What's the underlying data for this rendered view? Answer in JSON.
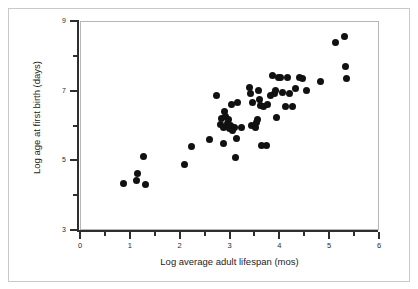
{
  "figure": {
    "background_color": "#ffffff",
    "frame_color": "#c9c9c9",
    "panel_border_color": "#b6b6b6",
    "axis_color": "#2e2e2e",
    "point_color": "#111111"
  },
  "chart_data": {
    "type": "scatter",
    "title": "",
    "xlabel": "Log average adult lifespan (mos)",
    "ylabel": "Log age at first birth (days)",
    "xlim": [
      0,
      6
    ],
    "ylim": [
      3,
      9
    ],
    "grid": false,
    "legend": null,
    "xticks": [
      0,
      1,
      2,
      3,
      4,
      5,
      6
    ],
    "xtick_labels": [
      "0",
      "1",
      "2",
      "3",
      "4",
      "5",
      "6"
    ],
    "xminor_ticks": [
      0.5,
      1.5,
      2.5,
      3.5,
      4.5,
      5.5
    ],
    "yticks": [
      3,
      5,
      7,
      9
    ],
    "ytick_labels": [
      "3",
      "5",
      "7",
      "9"
    ],
    "yminor_ticks": [
      4,
      6,
      8
    ],
    "marker": "filled-circle",
    "marker_size_px": 7,
    "n_points": 60,
    "points": [
      {
        "x": 0.85,
        "y": 4.37
      },
      {
        "x": 1.12,
        "y": 4.45
      },
      {
        "x": 1.14,
        "y": 4.64
      },
      {
        "x": 1.25,
        "y": 5.13
      },
      {
        "x": 1.3,
        "y": 4.33
      },
      {
        "x": 2.07,
        "y": 4.9
      },
      {
        "x": 2.21,
        "y": 5.44
      },
      {
        "x": 2.57,
        "y": 5.62
      },
      {
        "x": 2.72,
        "y": 6.9
      },
      {
        "x": 2.8,
        "y": 6.07
      },
      {
        "x": 2.82,
        "y": 6.24
      },
      {
        "x": 2.85,
        "y": 5.52
      },
      {
        "x": 2.86,
        "y": 5.97
      },
      {
        "x": 2.88,
        "y": 6.42
      },
      {
        "x": 2.9,
        "y": 6.3
      },
      {
        "x": 2.93,
        "y": 6.1
      },
      {
        "x": 2.95,
        "y": 6.01
      },
      {
        "x": 2.96,
        "y": 6.2
      },
      {
        "x": 2.98,
        "y": 5.94
      },
      {
        "x": 3.0,
        "y": 6.04
      },
      {
        "x": 3.02,
        "y": 6.62
      },
      {
        "x": 3.05,
        "y": 5.88
      },
      {
        "x": 3.08,
        "y": 5.98
      },
      {
        "x": 3.1,
        "y": 5.12
      },
      {
        "x": 3.12,
        "y": 5.65
      },
      {
        "x": 3.14,
        "y": 6.7
      },
      {
        "x": 3.22,
        "y": 5.98
      },
      {
        "x": 3.38,
        "y": 7.12
      },
      {
        "x": 3.4,
        "y": 6.95
      },
      {
        "x": 3.42,
        "y": 6.02
      },
      {
        "x": 3.45,
        "y": 6.7
      },
      {
        "x": 3.5,
        "y": 5.97
      },
      {
        "x": 3.52,
        "y": 6.12
      },
      {
        "x": 3.55,
        "y": 6.2
      },
      {
        "x": 3.56,
        "y": 7.04
      },
      {
        "x": 3.58,
        "y": 6.78
      },
      {
        "x": 3.6,
        "y": 6.6
      },
      {
        "x": 3.62,
        "y": 5.46
      },
      {
        "x": 3.66,
        "y": 6.56
      },
      {
        "x": 3.72,
        "y": 5.46
      },
      {
        "x": 3.74,
        "y": 6.62
      },
      {
        "x": 3.8,
        "y": 6.88
      },
      {
        "x": 3.84,
        "y": 7.45
      },
      {
        "x": 3.88,
        "y": 6.96
      },
      {
        "x": 3.9,
        "y": 7.02
      },
      {
        "x": 3.92,
        "y": 6.25
      },
      {
        "x": 3.96,
        "y": 7.42
      },
      {
        "x": 4.0,
        "y": 7.42
      },
      {
        "x": 4.05,
        "y": 6.98
      },
      {
        "x": 4.1,
        "y": 6.58
      },
      {
        "x": 4.15,
        "y": 7.42
      },
      {
        "x": 4.18,
        "y": 6.94
      },
      {
        "x": 4.25,
        "y": 6.56
      },
      {
        "x": 4.3,
        "y": 7.08
      },
      {
        "x": 4.38,
        "y": 7.42
      },
      {
        "x": 4.45,
        "y": 7.38
      },
      {
        "x": 4.52,
        "y": 7.02
      },
      {
        "x": 4.8,
        "y": 7.3
      },
      {
        "x": 5.1,
        "y": 8.42
      },
      {
        "x": 5.28,
        "y": 8.58
      },
      {
        "x": 5.3,
        "y": 7.72
      },
      {
        "x": 5.32,
        "y": 7.38
      }
    ]
  },
  "axes": {
    "x_title": "Log average adult lifespan (mos)",
    "y_title": "Log age at first birth (days)",
    "x_labels": [
      "0",
      "1",
      "2",
      "3",
      "4",
      "5",
      "6"
    ],
    "y_labels": [
      "9",
      "7",
      "5",
      "3"
    ]
  }
}
